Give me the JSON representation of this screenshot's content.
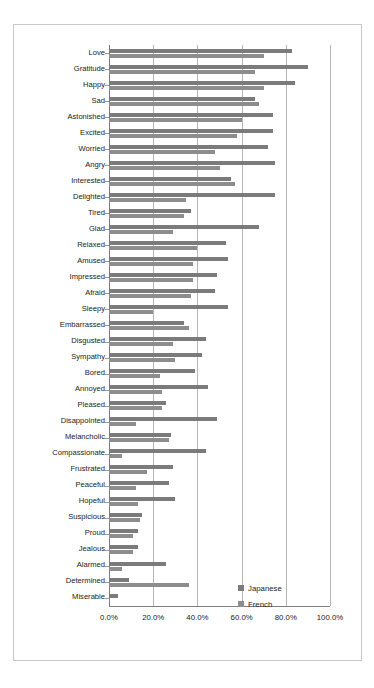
{
  "page": {
    "top_ghost_text": "",
    "bottom_ghost_text": ""
  },
  "legend": {
    "position": "inside-right",
    "items": [
      {
        "label": "Japanese",
        "color": "#7b7b7b",
        "swatch_icon": "square-swatch-icon"
      },
      {
        "label": "French",
        "color": "#8d8d8d",
        "swatch_icon": "square-swatch-icon"
      }
    ]
  },
  "axis": {
    "x_ticks": [
      "0.0%",
      "20.0%",
      "40.0%",
      "60.0%",
      "80.0%",
      "100.0%"
    ],
    "x_tick_values": [
      0,
      20,
      40,
      60,
      80,
      100
    ]
  },
  "chart_data": {
    "type": "bar",
    "orientation": "horizontal",
    "title": "",
    "subtitle": "",
    "xlabel": "",
    "ylabel": "",
    "xlim": [
      0,
      100
    ],
    "grid": true,
    "grid_axis": "x",
    "legend_position": "inside-right",
    "value_format": "percent",
    "categories": [
      "Love",
      "Gratitude",
      "Happy",
      "Sad",
      "Astonished",
      "Excited",
      "Worried",
      "Angry",
      "Interested",
      "Delighted",
      "Tired",
      "Glad",
      "Relaxed",
      "Amused",
      "Impressed",
      "Afraid",
      "Sleepy",
      "Embarrassed",
      "Disgusted",
      "Sympathy",
      "Bored",
      "Annoyed",
      "Pleased",
      "Disappointed",
      "Melancholic",
      "Compassionate",
      "Frustrated",
      "Peaceful",
      "Hopeful",
      "Suspicious",
      "Proud",
      "Jealous",
      "Alarmed",
      "Determined",
      "Miserable"
    ],
    "series": [
      {
        "name": "Japanese",
        "color": "#7b7b7b",
        "values": [
          83,
          90,
          84,
          66,
          74,
          74,
          72,
          75,
          55,
          75,
          37,
          68,
          53,
          54,
          49,
          48,
          54,
          34,
          44,
          42,
          39,
          45,
          26,
          49,
          28,
          44,
          29,
          27,
          30,
          15,
          13,
          13,
          26,
          9,
          4
        ]
      },
      {
        "name": "French",
        "color": "#8d8d8d",
        "values": [
          70,
          66,
          70,
          68,
          60,
          58,
          48,
          50,
          57,
          35,
          34,
          29,
          40,
          38,
          38,
          37,
          20,
          36,
          29,
          30,
          23,
          24,
          24,
          12,
          27,
          6,
          17,
          12,
          13,
          14,
          11,
          11,
          6,
          36,
          0
        ]
      }
    ]
  }
}
